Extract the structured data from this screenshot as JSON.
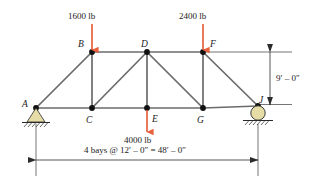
{
  "diagram": {
    "colors": {
      "member": "#6b6b6b",
      "node": "#111111",
      "load_arrow": "#e8603c",
      "support_fill": "#e6dca6",
      "support_stroke": "#2a2a2a",
      "dimension": "#2b2b2b",
      "text": "#1a1a1a",
      "background": "#ffffff"
    },
    "nodes": [
      {
        "id": "A",
        "label": "A",
        "x": 36,
        "y": 108,
        "label_x": 22,
        "label_y": 100,
        "support": "pin"
      },
      {
        "id": "B",
        "label": "B",
        "x": 92,
        "y": 52,
        "label_x": 78,
        "label_y": 40,
        "support": "none"
      },
      {
        "id": "C",
        "label": "C",
        "x": 92,
        "y": 108,
        "label_x": 86,
        "label_y": 116,
        "support": "none"
      },
      {
        "id": "D",
        "label": "D",
        "x": 147,
        "y": 52,
        "label_x": 141,
        "label_y": 40,
        "support": "none"
      },
      {
        "id": "E",
        "label": "E",
        "x": 147,
        "y": 108,
        "label_x": 152,
        "label_y": 115,
        "support": "none"
      },
      {
        "id": "F",
        "label": "F",
        "x": 203,
        "y": 52,
        "label_x": 210,
        "label_y": 40,
        "support": "none"
      },
      {
        "id": "G",
        "label": "G",
        "x": 203,
        "y": 108,
        "label_x": 197,
        "label_y": 116,
        "support": "none"
      },
      {
        "id": "J",
        "label": "J",
        "x": 258,
        "y": 106,
        "label_x": 259,
        "label_y": 96,
        "support": "roller"
      }
    ],
    "members": [
      {
        "from": "A",
        "to": "B",
        "type": "diagonal"
      },
      {
        "from": "A",
        "to": "C",
        "type": "bottom-chord"
      },
      {
        "from": "B",
        "to": "C",
        "type": "vertical"
      },
      {
        "from": "B",
        "to": "D",
        "type": "top-chord"
      },
      {
        "from": "C",
        "to": "D",
        "type": "diagonal"
      },
      {
        "from": "C",
        "to": "E",
        "type": "bottom-chord"
      },
      {
        "from": "D",
        "to": "E",
        "type": "vertical"
      },
      {
        "from": "D",
        "to": "F",
        "type": "top-chord"
      },
      {
        "from": "D",
        "to": "G",
        "type": "diagonal"
      },
      {
        "from": "E",
        "to": "G",
        "type": "bottom-chord"
      },
      {
        "from": "F",
        "to": "G",
        "type": "vertical"
      },
      {
        "from": "F",
        "to": "J",
        "type": "diagonal"
      },
      {
        "from": "G",
        "to": "J",
        "type": "bottom-chord"
      }
    ],
    "loads": [
      {
        "id": "load-B",
        "label": "1600 lb",
        "magnitude": 1600,
        "unit": "lb",
        "at_node": "B",
        "direction": "down",
        "arrow_x": 92,
        "arrow_top": 24,
        "arrow_bottom": 50,
        "label_x": 68,
        "label_y": 12
      },
      {
        "id": "load-F",
        "label": "2400 lb",
        "magnitude": 2400,
        "unit": "lb",
        "at_node": "F",
        "direction": "down",
        "arrow_x": 203,
        "arrow_top": 24,
        "arrow_bottom": 50,
        "label_x": 179,
        "label_y": 12
      },
      {
        "id": "load-E",
        "label": "4000 lb",
        "magnitude": 4000,
        "unit": "lb",
        "at_node": "E",
        "direction": "down",
        "arrow_x": 147,
        "arrow_top": 110,
        "arrow_bottom": 132,
        "label_x": 124,
        "label_y": 136
      }
    ],
    "supports": [
      {
        "id": "support-A",
        "type": "pin",
        "at_node": "A",
        "x": 36,
        "y": 108
      },
      {
        "id": "support-J",
        "type": "roller",
        "at_node": "J",
        "x": 258,
        "y": 106
      }
    ],
    "dimensions": [
      {
        "id": "span-dimension",
        "label": "4 bays @ 12′ – 0″ = 48′ – 0″",
        "orientation": "horizontal",
        "from_x": 36,
        "to_x": 258,
        "y": 160,
        "label_x": 84,
        "label_y": 146
      },
      {
        "id": "height-dimension",
        "label": "9′ – 0″",
        "orientation": "vertical",
        "x": 270,
        "from_y": 52,
        "to_y": 106,
        "label_x": 276,
        "label_y": 74
      }
    ]
  }
}
